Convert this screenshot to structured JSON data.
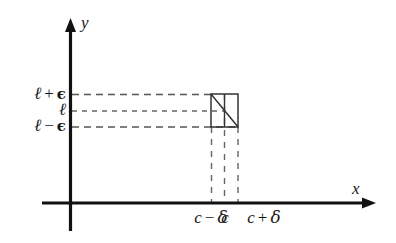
{
  "figure": {
    "background_color": "#ffffff",
    "line_color": "#1a1a1a",
    "dash_color": "#555555",
    "width": 396,
    "height": 243
  },
  "axes": {
    "x_axis_label": "x",
    "y_axis_label": "y",
    "origin": {
      "x": 70,
      "y": 203
    },
    "x_axis_start": 42,
    "x_axis_end": 376,
    "y_axis_top": 18,
    "y_axis_bottom": 231
  },
  "y_labels": {
    "upper": {
      "ell": "ℓ",
      "operator": "+",
      "epsilon": "ϵ",
      "y": 94
    },
    "middle": {
      "ell": "ℓ",
      "y": 111
    },
    "lower": {
      "ell": "ℓ",
      "operator": "−",
      "epsilon": "ϵ",
      "y": 127
    }
  },
  "x_labels": {
    "left": {
      "c": "c",
      "operator": "−",
      "delta": "δ",
      "x": 211
    },
    "center": {
      "c": "c",
      "x": 224
    },
    "right": {
      "c": "c",
      "operator": "+",
      "delta": "δ",
      "x": 238
    }
  },
  "box": {
    "left": 211,
    "right": 238,
    "top": 94,
    "bottom": 127,
    "diagonal": "top-left-to-bottom-right",
    "center_vertical_line_x": 224
  },
  "guide_lines": {
    "horizontal": [
      {
        "name": "l-plus-epsilon",
        "y": 94,
        "from_x": 72,
        "to_x": 211,
        "style": "dashed"
      },
      {
        "name": "l",
        "y": 111,
        "from_x": 72,
        "to_x": 224,
        "style": "dotted"
      },
      {
        "name": "l-minus-epsilon",
        "y": 127,
        "from_x": 72,
        "to_x": 238,
        "style": "dashed"
      }
    ],
    "vertical": [
      {
        "name": "c-minus-delta",
        "x": 211,
        "from_y": 127,
        "to_y": 203,
        "style": "dashed"
      },
      {
        "name": "c",
        "x": 224,
        "from_y": 94,
        "to_y": 203,
        "style": "dashed"
      },
      {
        "name": "c-plus-delta",
        "x": 238,
        "from_y": 127,
        "to_y": 203,
        "style": "dashed"
      }
    ]
  }
}
